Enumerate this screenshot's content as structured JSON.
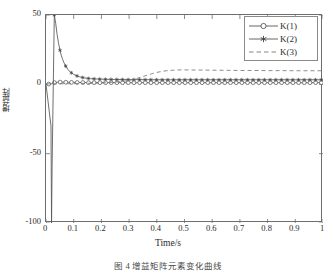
{
  "figure": {
    "background_color": "#ffffff",
    "axes_color": "#6e6e6e",
    "caption": "图 4  增益矩阵元素变化曲线"
  },
  "chart_data": {
    "type": "line",
    "title": "",
    "xlabel": "Time/s",
    "ylabel": "增益阵",
    "xlim": [
      0,
      1
    ],
    "ylim": [
      -100,
      50
    ],
    "grid": false,
    "legend_position": "top-right",
    "xticks": [
      "0",
      "0.1",
      "0.2",
      "0.3",
      "0.4",
      "0.5",
      "0.6",
      "0.7",
      "0.8",
      "0.9",
      "1"
    ],
    "xtick_values": [
      0,
      0.1,
      0.2,
      0.3,
      0.4,
      0.5,
      0.6,
      0.7,
      0.8,
      0.9,
      1
    ],
    "yticks": [
      "50",
      "0",
      "-50",
      "-100"
    ],
    "ytick_values": [
      50,
      0,
      -50,
      -100
    ],
    "series": [
      {
        "name": "K(1)",
        "marker": "circle",
        "linestyle": "solid",
        "color": "#555555",
        "x": [
          0.0,
          0.02,
          0.03,
          0.04,
          0.05,
          0.06,
          0.07,
          0.08,
          0.09,
          0.1,
          0.12,
          0.14,
          0.16,
          0.18,
          0.2,
          0.22,
          0.24,
          0.26,
          0.28,
          0.3,
          0.33,
          0.36,
          0.39,
          0.42,
          0.45,
          0.48,
          0.51,
          0.54,
          0.57,
          0.6,
          0.63,
          0.66,
          0.69,
          0.72,
          0.75,
          0.78,
          0.81,
          0.84,
          0.87,
          0.9,
          0.93,
          0.96,
          1.0
        ],
        "y": [
          0.0,
          0.4,
          1.2,
          1.5,
          1.6,
          1.6,
          1.5,
          1.5,
          1.4,
          1.4,
          1.3,
          1.3,
          1.2,
          1.2,
          1.2,
          1.2,
          1.2,
          1.2,
          1.2,
          1.2,
          1.2,
          1.2,
          1.2,
          1.2,
          1.2,
          1.2,
          1.2,
          1.2,
          1.2,
          1.2,
          1.2,
          1.2,
          1.2,
          1.2,
          1.2,
          1.2,
          1.2,
          1.2,
          1.2,
          1.2,
          1.2,
          1.2,
          1.2
        ]
      },
      {
        "name": "K(2)",
        "marker": "asterisk",
        "linestyle": "solid",
        "color": "#555555",
        "x": [
          0.0,
          0.018,
          0.02,
          0.022,
          0.03,
          0.035,
          0.04,
          0.045,
          0.05,
          0.055,
          0.06,
          0.065,
          0.07,
          0.08,
          0.09,
          0.1,
          0.11,
          0.12,
          0.13,
          0.14,
          0.15,
          0.16,
          0.17,
          0.18,
          0.2,
          0.22,
          0.25,
          0.3,
          0.35,
          0.4,
          0.45,
          0.5,
          0.55,
          0.6,
          0.65,
          0.7,
          0.75,
          0.8,
          0.85,
          0.9,
          0.95,
          1.0
        ],
        "y": [
          0.0,
          -30.0,
          -100.0,
          -60.0,
          50.0,
          44.0,
          36.0,
          30.0,
          25.0,
          21.0,
          18.0,
          15.5,
          13.5,
          10.5,
          8.5,
          7.2,
          6.2,
          5.5,
          5.0,
          4.6,
          4.3,
          4.1,
          4.0,
          3.9,
          3.7,
          3.6,
          3.5,
          3.4,
          3.4,
          3.3,
          3.3,
          3.3,
          3.3,
          3.3,
          3.3,
          3.3,
          3.3,
          3.3,
          3.3,
          3.3,
          3.3,
          3.3
        ]
      },
      {
        "name": "K(3)",
        "marker": "none",
        "linestyle": "dashed",
        "color": "#777777",
        "x": [
          0.0,
          0.05,
          0.1,
          0.15,
          0.2,
          0.25,
          0.28,
          0.3,
          0.32,
          0.34,
          0.36,
          0.38,
          0.4,
          0.42,
          0.44,
          0.46,
          0.48,
          0.5,
          0.55,
          0.6,
          0.65,
          0.7,
          0.75,
          0.8,
          0.85,
          0.9,
          0.95,
          1.0
        ],
        "y": [
          0.3,
          0.4,
          0.5,
          0.7,
          1.0,
          1.6,
          2.2,
          2.8,
          3.8,
          5.0,
          6.3,
          7.5,
          8.6,
          9.4,
          9.9,
          10.2,
          10.4,
          10.4,
          10.3,
          10.2,
          10.1,
          10.0,
          10.0,
          9.9,
          9.9,
          9.8,
          9.8,
          9.8
        ]
      }
    ]
  }
}
